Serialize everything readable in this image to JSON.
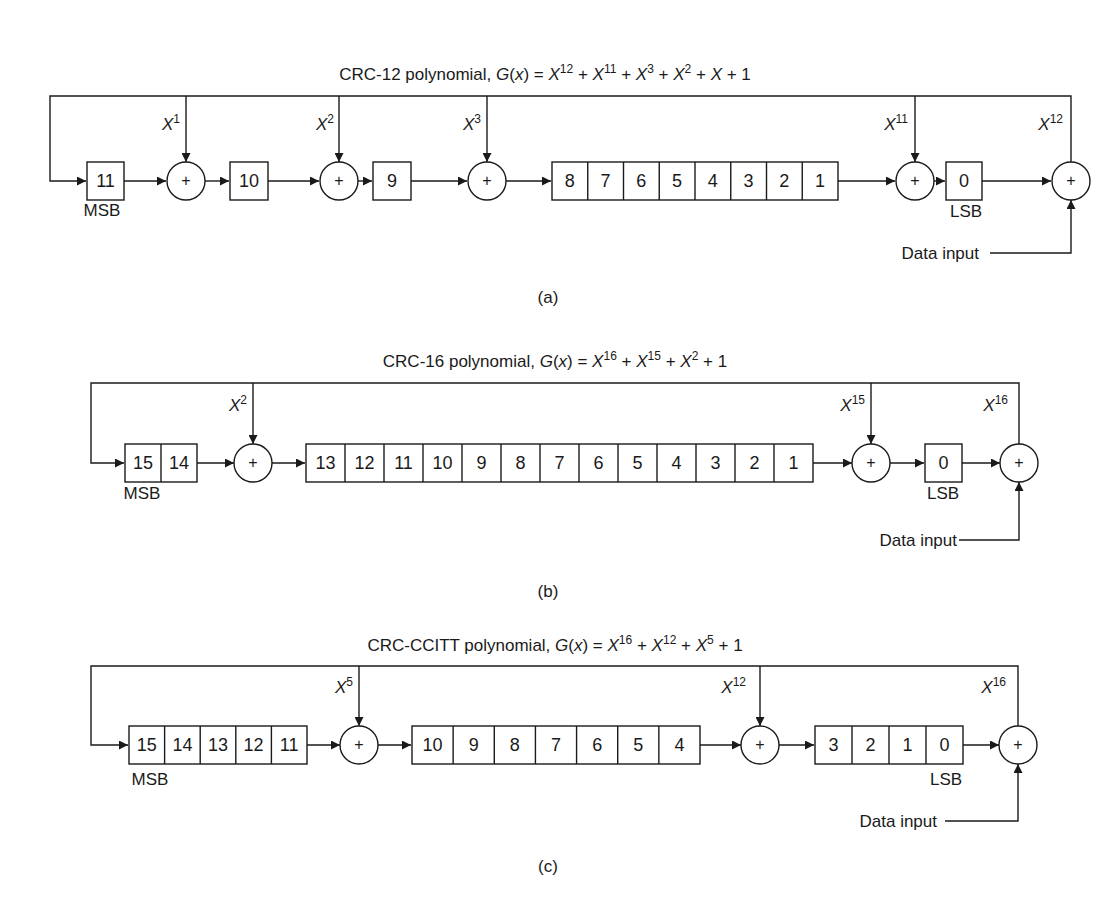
{
  "figure": {
    "panels": [
      {
        "id": "a",
        "caption": "(a)",
        "title_prefix": "CRC-12 polynomial, ",
        "polynomial": "G(x) = X^12 + X^11 + X^3 + X^2 + X + 1",
        "title_terms": [
          [
            "12"
          ],
          [
            "11"
          ],
          [
            "3"
          ],
          [
            "2"
          ]
        ],
        "blocks": [
          {
            "cells": [
              "11"
            ],
            "label": "MSB"
          },
          {
            "type": "adder",
            "tap": "X^1"
          },
          {
            "cells": [
              "10"
            ]
          },
          {
            "type": "adder",
            "tap": "X^2"
          },
          {
            "cells": [
              "9"
            ]
          },
          {
            "type": "adder",
            "tap": "X^3"
          },
          {
            "cells": [
              "8",
              "7",
              "6",
              "5",
              "4",
              "3",
              "2",
              "1"
            ]
          },
          {
            "type": "adder",
            "tap": "X^11"
          },
          {
            "cells": [
              "0"
            ],
            "label": "LSB"
          },
          {
            "type": "adder",
            "tap": "X^12"
          }
        ],
        "msb_label": "MSB",
        "lsb_label": "LSB",
        "data_input_label": "Data input"
      },
      {
        "id": "b",
        "caption": "(b)",
        "title_prefix": "CRC-16 polynomial, ",
        "polynomial": "G(x) = X^16 + X^15 + X^2 + 1",
        "blocks": [
          {
            "cells": [
              "15",
              "14"
            ],
            "label": "MSB"
          },
          {
            "type": "adder",
            "tap": "X^2"
          },
          {
            "cells": [
              "13",
              "12",
              "11",
              "10",
              "9",
              "8",
              "7",
              "6",
              "5",
              "4",
              "3",
              "2",
              "1"
            ]
          },
          {
            "type": "adder",
            "tap": "X^15"
          },
          {
            "cells": [
              "0"
            ],
            "label": "LSB"
          },
          {
            "type": "adder",
            "tap": "X^16"
          }
        ],
        "msb_label": "MSB",
        "lsb_label": "LSB",
        "data_input_label": "Data input"
      },
      {
        "id": "c",
        "caption": "(c)",
        "title_prefix": "CRC-CCITT polynomial, ",
        "polynomial": "G(x) = X^16 + X^12 + X^5 + 1",
        "blocks": [
          {
            "cells": [
              "15",
              "14",
              "13",
              "12",
              "11"
            ],
            "label": "MSB"
          },
          {
            "type": "adder",
            "tap": "X^5"
          },
          {
            "cells": [
              "10",
              "9",
              "8",
              "7",
              "6",
              "5",
              "4"
            ]
          },
          {
            "type": "adder",
            "tap": "X^12"
          },
          {
            "cells": [
              "3",
              "2",
              "1",
              "0"
            ],
            "label": "LSB"
          },
          {
            "type": "adder",
            "tap": "X^16"
          }
        ],
        "msb_label": "MSB",
        "lsb_label": "LSB",
        "data_input_label": "Data input"
      }
    ],
    "text": {
      "x": "X",
      "gx": "G",
      "x_lower": "x",
      "plus": "+",
      "one": "1",
      "eq": " = ",
      "paren_open": "(",
      "paren_close": ")"
    }
  }
}
